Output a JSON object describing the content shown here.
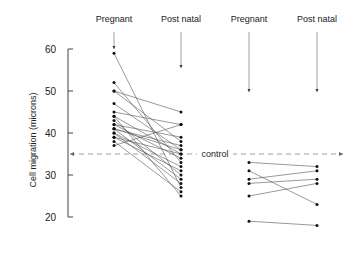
{
  "chart_data": {
    "type": "line",
    "title": "",
    "xlabel": "",
    "ylabel": "Cell migration (microns)",
    "ylim": [
      18,
      62
    ],
    "yticks": [
      20,
      30,
      40,
      50,
      60
    ],
    "categories": [
      "Pregnant",
      "Post natal",
      "Pregnant",
      "Post natal"
    ],
    "reference_line": {
      "label": "control",
      "value": 35
    },
    "groups": [
      {
        "name": "Group 1",
        "pairs": [
          [
            59,
            27
          ],
          [
            52,
            33
          ],
          [
            50,
            45
          ],
          [
            50,
            38
          ],
          [
            47,
            36
          ],
          [
            45,
            42
          ],
          [
            44,
            35
          ],
          [
            43,
            30
          ],
          [
            42,
            39
          ],
          [
            42,
            34
          ],
          [
            41,
            29
          ],
          [
            41,
            37
          ],
          [
            40,
            32
          ],
          [
            40,
            28
          ],
          [
            39,
            31
          ],
          [
            38,
            26
          ],
          [
            37,
            42
          ],
          [
            44,
            25
          ],
          [
            41,
            36
          ],
          [
            39,
            35
          ]
        ]
      },
      {
        "name": "Group 2",
        "pairs": [
          [
            33,
            32
          ],
          [
            31,
            23
          ],
          [
            29,
            31
          ],
          [
            28,
            29
          ],
          [
            25,
            28
          ],
          [
            19,
            18
          ]
        ]
      }
    ]
  }
}
